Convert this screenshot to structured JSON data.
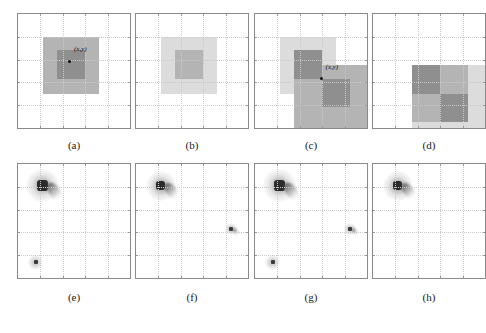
{
  "figure": {
    "title": "",
    "background_color": "#ffffff",
    "axis_color": "#8a8a8a",
    "grid_color": "#c9c9c9",
    "marker_color": "#111111",
    "panel_count": 8,
    "columns": 4,
    "rows": 2
  },
  "colors": {
    "white": "#ffffff",
    "light_gray": "#dcdcdc",
    "mid_gray": "#b4b4b4",
    "dark_gray": "#8f8f8f",
    "blob_core": "#2b2b2b",
    "blob_mid": "#6f6f6f",
    "blob_faint": "#bdbdbd"
  },
  "captions": {
    "row_top": [
      "(a)",
      "(b)",
      "(c)",
      "(d)"
    ],
    "row_bottom": [
      "(e)",
      "(f)",
      "(g)",
      "(h)"
    ]
  },
  "point_label": "(x,y)",
  "panels": [
    {
      "id": "a",
      "caption": "(a)",
      "type": "block-image",
      "has_point_marker": true,
      "point_label": "(x,y)",
      "point_x_pct": 46,
      "point_y_pct": 42,
      "label_x_pct": 50,
      "label_y_pct": 28,
      "blocks": [
        {
          "name": "outer-square",
          "x_pct": 22,
          "y_pct": 20,
          "w_pct": 50,
          "h_pct": 50,
          "color": "#b4b4b4"
        },
        {
          "name": "inner-square",
          "x_pct": 35,
          "y_pct": 32,
          "w_pct": 25,
          "h_pct": 25,
          "color": "#8f8f8f"
        }
      ]
    },
    {
      "id": "b",
      "caption": "(b)",
      "type": "block-image",
      "has_point_marker": false,
      "point_label": "",
      "blocks": [
        {
          "name": "outer-square",
          "x_pct": 22,
          "y_pct": 20,
          "w_pct": 50,
          "h_pct": 50,
          "color": "#dcdcdc"
        },
        {
          "name": "inner-square",
          "x_pct": 35,
          "y_pct": 32,
          "w_pct": 25,
          "h_pct": 25,
          "color": "#b4b4b4"
        }
      ]
    },
    {
      "id": "c",
      "caption": "(c)",
      "type": "block-image",
      "has_point_marker": true,
      "point_label": "(x,y)",
      "point_x_pct": 59,
      "point_y_pct": 57,
      "label_x_pct": 63,
      "label_y_pct": 44,
      "blocks": [
        {
          "name": "upper-light-square",
          "x_pct": 22,
          "y_pct": 20,
          "w_pct": 50,
          "h_pct": 25,
          "color": "#dcdcdc"
        },
        {
          "name": "left-light-square",
          "x_pct": 22,
          "y_pct": 45,
          "w_pct": 13,
          "h_pct": 25,
          "color": "#dcdcdc"
        },
        {
          "name": "lower-mid-square",
          "x_pct": 35,
          "y_pct": 45,
          "w_pct": 65,
          "h_pct": 55,
          "color": "#b4b4b4"
        },
        {
          "name": "dark-block-upper-left",
          "x_pct": 35,
          "y_pct": 32,
          "w_pct": 25,
          "h_pct": 25,
          "color": "#8f8f8f"
        },
        {
          "name": "dark-block-lower-right",
          "x_pct": 60,
          "y_pct": 57,
          "w_pct": 25,
          "h_pct": 25,
          "color": "#8f8f8f"
        }
      ]
    },
    {
      "id": "d",
      "caption": "(d)",
      "type": "block-image",
      "has_point_marker": false,
      "point_label": "",
      "blocks": [
        {
          "name": "background-light-square",
          "x_pct": 35,
          "y_pct": 45,
          "w_pct": 65,
          "h_pct": 55,
          "color": "#dcdcdc"
        },
        {
          "name": "checker-dark-upper-left",
          "x_pct": 35,
          "y_pct": 45,
          "w_pct": 25,
          "h_pct": 25,
          "color": "#8f8f8f"
        },
        {
          "name": "checker-mid-upper-right",
          "x_pct": 60,
          "y_pct": 45,
          "w_pct": 25,
          "h_pct": 25,
          "color": "#b4b4b4"
        },
        {
          "name": "checker-mid-lower-left",
          "x_pct": 35,
          "y_pct": 70,
          "w_pct": 25,
          "h_pct": 25,
          "color": "#b4b4b4"
        },
        {
          "name": "checker-dark-lower-right",
          "x_pct": 60,
          "y_pct": 70,
          "w_pct": 25,
          "h_pct": 25,
          "color": "#8f8f8f"
        }
      ]
    },
    {
      "id": "e",
      "caption": "(e)",
      "type": "correlation-map",
      "spots": [
        {
          "name": "main-peak",
          "x_pct": 22,
          "y_pct": 19,
          "size_pct": 13,
          "intensity": "strong",
          "tail": true
        },
        {
          "name": "secondary-peak-bottom",
          "x_pct": 16,
          "y_pct": 86,
          "size_pct": 6,
          "intensity": "medium",
          "tail": false
        }
      ]
    },
    {
      "id": "f",
      "caption": "(f)",
      "type": "correlation-map",
      "spots": [
        {
          "name": "main-peak",
          "x_pct": 22,
          "y_pct": 19,
          "size_pct": 12,
          "intensity": "strong",
          "tail": true
        },
        {
          "name": "secondary-peak-right",
          "x_pct": 85,
          "y_pct": 57,
          "size_pct": 5,
          "intensity": "medium",
          "tail": true
        }
      ]
    },
    {
      "id": "g",
      "caption": "(g)",
      "type": "correlation-map",
      "spots": [
        {
          "name": "main-peak",
          "x_pct": 22,
          "y_pct": 19,
          "size_pct": 13,
          "intensity": "strong",
          "tail": true
        },
        {
          "name": "secondary-peak-right",
          "x_pct": 85,
          "y_pct": 57,
          "size_pct": 5,
          "intensity": "medium",
          "tail": true
        },
        {
          "name": "secondary-peak-bottom",
          "x_pct": 16,
          "y_pct": 86,
          "size_pct": 6,
          "intensity": "medium",
          "tail": false
        }
      ]
    },
    {
      "id": "h",
      "caption": "(h)",
      "type": "correlation-map",
      "spots": [
        {
          "name": "main-peak",
          "x_pct": 22,
          "y_pct": 19,
          "size_pct": 12,
          "intensity": "strong",
          "tail": true
        }
      ]
    }
  ],
  "chart_data": {
    "type": "heatmap",
    "title": "",
    "xlabel": "",
    "ylabel": "",
    "grid": true,
    "legend": "none",
    "subplots": [
      {
        "label": "(a)",
        "kind": "block-image",
        "grid_divisions": 5,
        "annotation": "(x,y)",
        "regions": [
          {
            "value": 0.45,
            "color": "#b4b4b4",
            "x": [
              0.22,
              0.72
            ],
            "y": [
              0.2,
              0.7
            ]
          },
          {
            "value": 0.7,
            "color": "#8f8f8f",
            "x": [
              0.35,
              0.6
            ],
            "y": [
              0.32,
              0.57
            ]
          }
        ]
      },
      {
        "label": "(b)",
        "kind": "block-image",
        "grid_divisions": 5,
        "annotation": "",
        "regions": [
          {
            "value": 0.2,
            "color": "#dcdcdc",
            "x": [
              0.22,
              0.72
            ],
            "y": [
              0.2,
              0.7
            ]
          },
          {
            "value": 0.45,
            "color": "#b4b4b4",
            "x": [
              0.35,
              0.6
            ],
            "y": [
              0.32,
              0.57
            ]
          }
        ]
      },
      {
        "label": "(c)",
        "kind": "block-image",
        "grid_divisions": 5,
        "annotation": "(x,y)",
        "regions": [
          {
            "value": 0.2,
            "color": "#dcdcdc",
            "x": [
              0.22,
              0.72
            ],
            "y": [
              0.2,
              0.45
            ]
          },
          {
            "value": 0.2,
            "color": "#dcdcdc",
            "x": [
              0.22,
              0.35
            ],
            "y": [
              0.45,
              0.7
            ]
          },
          {
            "value": 0.45,
            "color": "#b4b4b4",
            "x": [
              0.35,
              1.0
            ],
            "y": [
              0.45,
              1.0
            ]
          },
          {
            "value": 0.7,
            "color": "#8f8f8f",
            "x": [
              0.35,
              0.6
            ],
            "y": [
              0.32,
              0.57
            ]
          },
          {
            "value": 0.7,
            "color": "#8f8f8f",
            "x": [
              0.6,
              0.85
            ],
            "y": [
              0.57,
              0.82
            ]
          }
        ]
      },
      {
        "label": "(d)",
        "kind": "block-image",
        "grid_divisions": 5,
        "annotation": "",
        "regions": [
          {
            "value": 0.2,
            "color": "#dcdcdc",
            "x": [
              0.35,
              1.0
            ],
            "y": [
              0.45,
              1.0
            ]
          },
          {
            "value": 0.7,
            "color": "#8f8f8f",
            "x": [
              0.35,
              0.6
            ],
            "y": [
              0.45,
              0.7
            ]
          },
          {
            "value": 0.45,
            "color": "#b4b4b4",
            "x": [
              0.6,
              0.85
            ],
            "y": [
              0.45,
              0.7
            ]
          },
          {
            "value": 0.45,
            "color": "#b4b4b4",
            "x": [
              0.35,
              0.6
            ],
            "y": [
              0.7,
              0.95
            ]
          },
          {
            "value": 0.7,
            "color": "#8f8f8f",
            "x": [
              0.6,
              0.85
            ],
            "y": [
              0.7,
              0.95
            ]
          }
        ]
      },
      {
        "label": "(e)",
        "kind": "correlation-map",
        "peaks": [
          {
            "x": 0.22,
            "y": 0.19,
            "amplitude": 1.0
          },
          {
            "x": 0.16,
            "y": 0.86,
            "amplitude": 0.45
          }
        ]
      },
      {
        "label": "(f)",
        "kind": "correlation-map",
        "peaks": [
          {
            "x": 0.22,
            "y": 0.19,
            "amplitude": 1.0
          },
          {
            "x": 0.85,
            "y": 0.57,
            "amplitude": 0.4
          }
        ]
      },
      {
        "label": "(g)",
        "kind": "correlation-map",
        "peaks": [
          {
            "x": 0.22,
            "y": 0.19,
            "amplitude": 1.0
          },
          {
            "x": 0.85,
            "y": 0.57,
            "amplitude": 0.4
          },
          {
            "x": 0.16,
            "y": 0.86,
            "amplitude": 0.45
          }
        ]
      },
      {
        "label": "(h)",
        "kind": "correlation-map",
        "peaks": [
          {
            "x": 0.22,
            "y": 0.19,
            "amplitude": 1.0
          }
        ]
      }
    ]
  }
}
